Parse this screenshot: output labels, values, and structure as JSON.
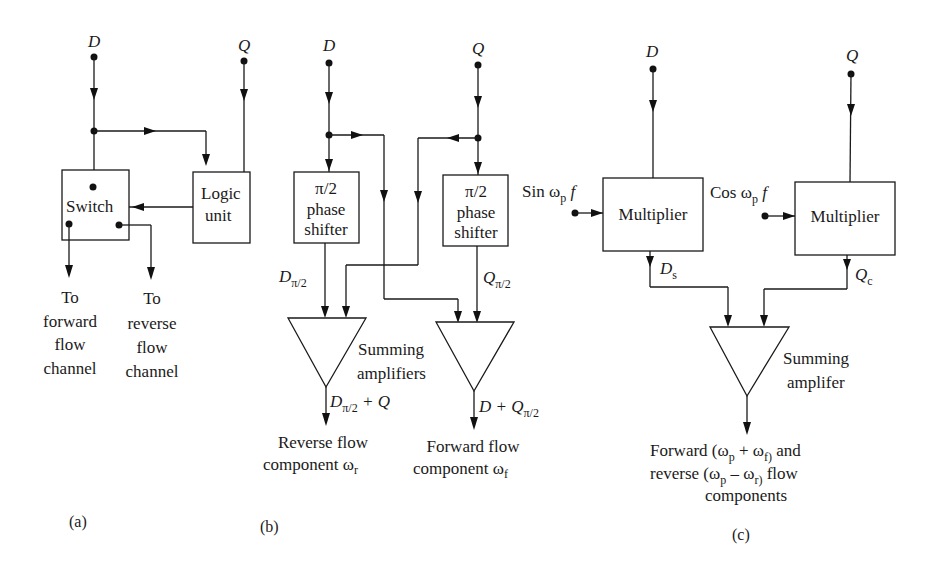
{
  "diagram": {
    "a": {
      "caption": "(a)",
      "input_d": "D",
      "input_q": "Q",
      "switch_label": "Switch",
      "logic_line1": "Logic",
      "logic_line2": "unit",
      "out_forward": [
        "To",
        "forward",
        "flow",
        "channel"
      ],
      "out_reverse": [
        "To",
        "reverse",
        "flow",
        "channel"
      ]
    },
    "b": {
      "caption": "(b)",
      "input_d": "D",
      "input_q": "Q",
      "shifter_line1": "π/2",
      "shifter_line2": "phase",
      "shifter_line3": "shifter",
      "d_shift_main": "D",
      "d_shift_sub": "π/2",
      "q_shift_main": "Q",
      "q_shift_sub": "π/2",
      "summing_line1": "Summing",
      "summing_line2": "amplifiers",
      "rev_out_main": "D",
      "rev_out_sub": "π/2",
      "rev_out_tail": " + Q",
      "fwd_out_main": "D + Q",
      "fwd_out_sub": "π/2",
      "rev_label_line1": "Reverse flow",
      "rev_label_line2": "component ω",
      "rev_label_sub": "r",
      "fwd_label_line1": "Forward flow",
      "fwd_label_line2": "component ω",
      "fwd_label_sub": "f"
    },
    "c": {
      "caption": "(c)",
      "input_d": "D",
      "input_q": "Q",
      "sin_label": "Sin ω",
      "sin_sub": "p",
      "sin_tail": " f",
      "cos_label": "Cos ω",
      "cos_sub": "p",
      "cos_tail": " f",
      "multiplier_label": "Multiplier",
      "ds_main": "D",
      "ds_sub": "s",
      "qc_main": "Q",
      "qc_sub": "c",
      "summing_line1": "Summing",
      "summing_line2": "amplifer",
      "out_line1_a": "Forward (ω",
      "out_line1_sub1": "p",
      "out_line1_b": " + ω",
      "out_line1_sub2": "f)",
      "out_line1_c": " and",
      "out_line2_a": "reverse (ω",
      "out_line2_sub1": "p",
      "out_line2_b": " – ω",
      "out_line2_sub2": "r)",
      "out_line2_c": "  flow",
      "out_line3": "components"
    }
  }
}
